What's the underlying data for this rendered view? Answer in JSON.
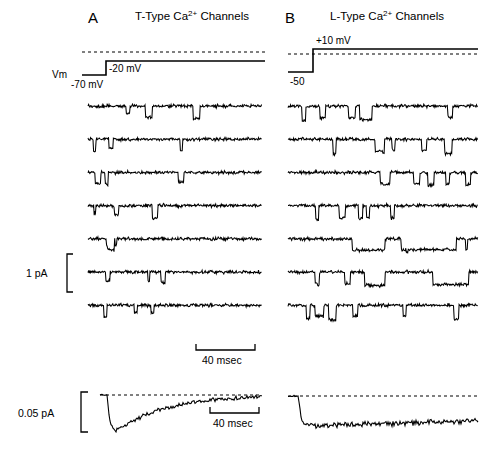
{
  "figure": {
    "background": "#ffffff",
    "trace_color": "#000000",
    "width": 499,
    "height": 473
  },
  "panels": [
    {
      "letter": "A",
      "title_prefix": "T-Type Ca",
      "title_sup": "2+",
      "title_suffix": " Channels",
      "vm_label": "Vm",
      "holding_label": "-70 mV",
      "step_label": "-20 mV"
    },
    {
      "letter": "B",
      "title_prefix": "L-Type Ca",
      "title_sup": "2+",
      "title_suffix": " Channels",
      "holding_label": "-50",
      "step_label": "+10 mV"
    }
  ],
  "scales": {
    "current_single": "1 pA",
    "current_average": "0.05 pA",
    "time_upper": "40 msec",
    "time_lower": "40 msec"
  },
  "chart_data": {
    "type": "line",
    "xlabel": "Time (msec)",
    "ylabel": "Current (pA)",
    "grid": false,
    "legend": "none",
    "sweeps_per_panel": 7,
    "panel_A": {
      "name": "T-Type Ca2+ Channels",
      "command_holding_mV": -70,
      "command_step_mV": -20,
      "single_channel_scale_pA": 1,
      "time_scale_msec": 40,
      "openings_description": "brief, flickery downward openings clustered early in the sweep, channel activity declines with time (inactivating)",
      "ensemble_average": {
        "peak_amplitude_pA": -0.05,
        "shape": "fast rising inward peak near sweep onset followed by decay back toward baseline (inactivation)",
        "baseline_dashed": true
      }
    },
    "panel_B": {
      "name": "L-Type Ca2+ Channels",
      "command_holding_mV": -50,
      "command_step_mV": 10,
      "single_channel_scale_pA": 1,
      "time_scale_msec": 40,
      "openings_description": "frequent, long-lasting square downward openings distributed throughout the entire sweep (non-inactivating)",
      "ensemble_average": {
        "peak_amplitude_pA": -0.05,
        "shape": "rapid step to a sustained inward level maintained for the whole sweep (little inactivation)",
        "baseline_dashed": true
      }
    }
  }
}
